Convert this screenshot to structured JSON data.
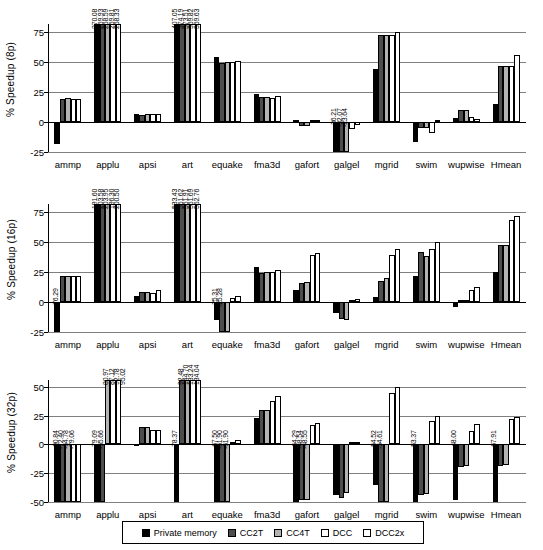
{
  "legend": {
    "position": "bottom-center",
    "entries": [
      {
        "label": "Private memory",
        "color": "#000000"
      },
      {
        "label": "CC2T",
        "color": "#4d4d4d"
      },
      {
        "label": "CC4T",
        "color": "#b3b3b3"
      },
      {
        "label": "DCC",
        "color": "#ffffff"
      },
      {
        "label": "DCC2x",
        "color": "#ffffff"
      }
    ]
  },
  "chart_data": [
    {
      "type": "bar",
      "title": "",
      "ylabel": "% Speedup (8p)",
      "xlabel": "",
      "ylim": [
        -25,
        82
      ],
      "yticks": [
        -25,
        0,
        25,
        50,
        75
      ],
      "grid": true,
      "categories": [
        "ammp",
        "applu",
        "apsi",
        "art",
        "equake",
        "fma3d",
        "gafort",
        "galgel",
        "mgrid",
        "swim",
        "wupwise",
        "Hmean"
      ],
      "series": [
        {
          "name": "Private memory",
          "values": [
            -18.5,
            270.08,
            6.5,
            407.05,
            54.5,
            23.5,
            2.0,
            -25.0,
            44.5,
            -16.5,
            3.5,
            15.5
          ]
        },
        {
          "name": "CC2T",
          "values": [
            19.5,
            269.93,
            6.3,
            374.19,
            49.5,
            21.0,
            -3.0,
            -25.0,
            72.5,
            -5.0,
            10.0,
            47.0
          ]
        },
        {
          "name": "CC4T",
          "values": [
            20.0,
            268.59,
            6.5,
            373.51,
            50.5,
            21.0,
            -3.0,
            -25.0,
            72.5,
            -5.0,
            10.5,
            46.5
          ]
        },
        {
          "name": "DCC",
          "values": [
            19.5,
            259.81,
            6.5,
            369.82,
            50.5,
            20.0,
            0.5,
            -6.0,
            73.0,
            -9.0,
            4.5,
            47.0
          ]
        },
        {
          "name": "DCC2x",
          "values": [
            19.5,
            268.33,
            6.5,
            369.63,
            51.0,
            21.5,
            0.5,
            -2.0,
            75.0,
            1.0,
            3.0,
            56.0
          ]
        }
      ],
      "value_labels": {
        "applu": [
          "270.08",
          "269.93",
          "268.59",
          "259.81",
          "268.33"
        ],
        "art": [
          "407.05",
          "374.19",
          "373.51",
          "369.82",
          "369.63"
        ],
        "galgel": [
          "-36.21",
          "-32.07",
          "-23.64"
        ]
      }
    },
    {
      "type": "bar",
      "title": "",
      "ylabel": "% Speedup (16p)",
      "xlabel": "",
      "ylim": [
        -25,
        82
      ],
      "yticks": [
        -25,
        0,
        25,
        50,
        75
      ],
      "grid": true,
      "categories": [
        "ammp",
        "applu",
        "apsi",
        "art",
        "equake",
        "fma3d",
        "gafort",
        "galgel",
        "mgrid",
        "swim",
        "wupwise",
        "Hmean"
      ],
      "series": [
        {
          "name": "Private memory",
          "values": [
            -76.29,
            191.6,
            5.0,
            533.43,
            -15.0,
            29.0,
            10.0,
            -9.5,
            4.5,
            22.0,
            -4.5,
            25.0
          ]
        },
        {
          "name": "CC2T",
          "values": [
            22.0,
            203.58,
            8.5,
            551.62,
            -25.31,
            24.5,
            16.0,
            -14.5,
            18.0,
            42.0,
            1.5,
            48.0
          ]
        },
        {
          "name": "CC4T",
          "values": [
            21.5,
            203.95,
            8.5,
            551.91,
            -25.28,
            25.0,
            17.0,
            -15.0,
            20.0,
            38.5,
            1.5,
            47.5
          ]
        },
        {
          "name": "DCC",
          "values": [
            21.5,
            196.3,
            8.0,
            551.69,
            3.5,
            25.5,
            39.5,
            0.5,
            39.5,
            44.5,
            10.0,
            68.5
          ]
        },
        {
          "name": "DCC2x",
          "values": [
            21.5,
            200.5,
            10.0,
            552.76,
            5.5,
            27.0,
            41.0,
            2.5,
            44.5,
            50.5,
            12.5,
            72.0
          ]
        }
      ],
      "value_labels": {
        "ammp": [
          "-76.29"
        ],
        "applu": [
          "191.60",
          "203.58",
          "203.95",
          "196.30",
          "200.50"
        ],
        "art": [
          "533.43",
          "551.62",
          "551.91",
          "551.69",
          "552.76"
        ],
        "equake": [
          "-25.31",
          "-25.28"
        ]
      }
    },
    {
      "type": "bar",
      "title": "",
      "ylabel": "% Speedup (32p)",
      "xlabel": "",
      "ylim": [
        -50,
        56
      ],
      "yticks": [
        -50,
        -25,
        0,
        25,
        50
      ],
      "grid": true,
      "categories": [
        "ammp",
        "applu",
        "apsi",
        "art",
        "equake",
        "fma3d",
        "gafort",
        "galgel",
        "mgrid",
        "swim",
        "wupwise",
        "Hmean"
      ],
      "series": [
        {
          "name": "Private memory",
          "values": [
            -90.84,
            -79.09,
            -1.0,
            -78.37,
            -67.5,
            23.0,
            -64.29,
            -43.5,
            -35.0,
            -53.37,
            -48.0,
            -67.91
          ]
        },
        {
          "name": "CC2T",
          "values": [
            -72.4,
            -55.66,
            15.0,
            92.48,
            -61.9,
            30.0,
            -48.54,
            -46.5,
            -54.52,
            -44.0,
            -19.5,
            -18.5
          ]
        },
        {
          "name": "CC4T",
          "values": [
            -64.78,
            80.97,
            15.0,
            144.7,
            -61.9,
            30.0,
            -48.55,
            -42.5,
            -54.61,
            -43.0,
            -19.0,
            -18.0
          ]
        },
        {
          "name": "DCC",
          "values": [
            -79.06,
            87.12,
            12.5,
            133.24,
            1.5,
            38.0,
            17.0,
            1.0,
            44.5,
            20.5,
            11.5,
            22.0
          ]
        },
        {
          "name": "DCC2x",
          "values": [
            -79.06,
            92.78,
            12.5,
            134.04,
            3.5,
            42.0,
            18.5,
            2.5,
            49.5,
            24.5,
            17.5,
            23.5
          ]
        }
      ],
      "value_labels": {
        "ammp": [
          "-90.84",
          "-72.40",
          "-64.78",
          "-79.06"
        ],
        "applu": [
          "-79.09",
          "-55.66",
          "80.97",
          "87.12",
          "92.78",
          "95.02"
        ],
        "art": [
          "-78.37",
          "92.48",
          "144.70",
          "133.24",
          "134.04"
        ],
        "equake": [
          "-67.50",
          "-61.90",
          "-61.90"
        ],
        "gafort": [
          "-64.29",
          "-48.54",
          "-48.55"
        ],
        "mgrid": [
          "-54.52",
          "-54.61"
        ],
        "swim": [
          "-53.37"
        ],
        "wupwise": [
          "-48.00"
        ],
        "Hmean": [
          "-67.91"
        ]
      }
    }
  ]
}
